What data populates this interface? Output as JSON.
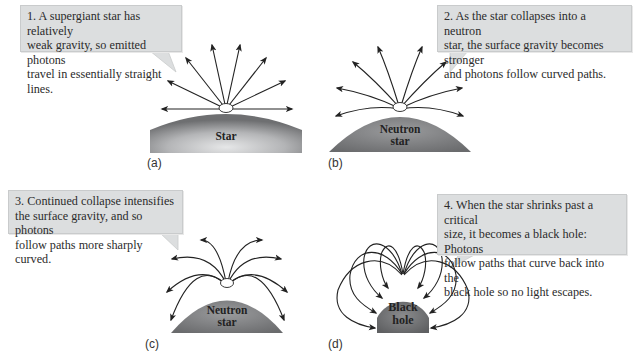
{
  "figure": {
    "panels": [
      {
        "id": "a",
        "label": "(a)",
        "caption": "1. A supergiant star has relatively weak gravity, so emitted photons travel in essentially straight lines.",
        "caption_lines": [
          "1. A supergiant star has relatively",
          "weak gravity, so emitted photons",
          "travel in essentially straight lines."
        ],
        "body_label": "Star",
        "photon_paths": "straight"
      },
      {
        "id": "b",
        "label": "(b)",
        "caption": "2. As the star collapses into a neutron star, the surface gravity becomes stronger and photons follow curved paths.",
        "caption_lines": [
          "2. As the star collapses into a neutron",
          "star, the surface gravity becomes stronger",
          "and photons follow curved paths."
        ],
        "body_label_lines": [
          "Neutron",
          "star"
        ],
        "photon_paths": "curved"
      },
      {
        "id": "c",
        "label": "(c)",
        "caption": "3. Continued collapse intensifies the surface gravity, and so photons follow paths more sharply curved.",
        "caption_lines": [
          "3. Continued collapse intensifies",
          "the surface gravity, and so photons",
          "follow paths more sharply curved."
        ],
        "body_label_lines": [
          "Neutron",
          "star"
        ],
        "photon_paths": "sharply curved"
      },
      {
        "id": "d",
        "label": "(d)",
        "caption": "4. When the star shrinks past a critical size, it becomes a black hole: Photons follow paths that curve back into the black hole so no light escapes.",
        "caption_lines": [
          "4. When the star shrinks past a critical",
          "size, it becomes a black hole: Photons",
          "follow paths that curve back into the",
          "black hole so no light escapes."
        ],
        "body_label_lines": [
          "Black",
          "hole"
        ],
        "photon_paths": "curve back"
      }
    ],
    "colors": {
      "callout_bg": "#dcdedf",
      "star_dark": "#6f7072",
      "star_light": "#d8d9da",
      "neutron_star": "#7a7b7d",
      "black_hole": "#6a6b6d",
      "arrow": "#222222"
    }
  }
}
